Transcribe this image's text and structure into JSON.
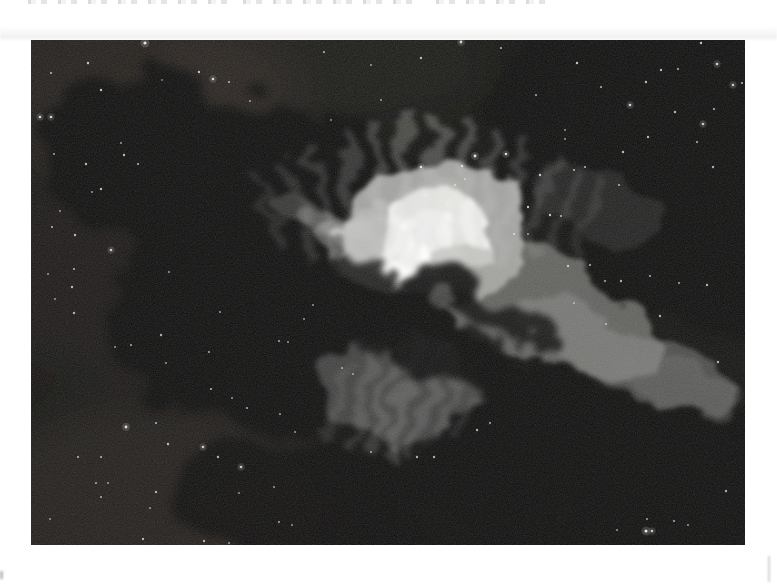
{
  "photo": {
    "subject": "edge-on-dark-nebula-astrophoto-with-bright-core-and-dust-lanes",
    "palette": {
      "page_background": "#ffffff",
      "space_black": "#060605",
      "warm_dust": "#54392e",
      "nebula_mid_gray": "#9a9a98",
      "nebula_core_white": "#f4f4f2",
      "star_white": "#eeeeec"
    },
    "stars": [
      [
        114,
        3,
        1.6,
        0.95
      ],
      [
        57,
        23,
        1.2,
        0.8
      ],
      [
        20,
        33,
        1.1,
        0.7
      ],
      [
        168,
        32,
        1.2,
        0.8
      ],
      [
        182,
        39,
        1.3,
        0.85
      ],
      [
        131,
        40,
        0.9,
        0.5
      ],
      [
        198,
        42,
        1.1,
        0.7
      ],
      [
        70,
        50,
        1.2,
        0.8
      ],
      [
        219,
        61,
        1.0,
        0.6
      ],
      [
        9,
        77,
        1.3,
        0.85
      ],
      [
        20,
        77,
        1.3,
        0.85
      ],
      [
        93,
        115,
        1.2,
        0.75
      ],
      [
        55,
        124,
        1.2,
        0.75
      ],
      [
        107,
        124,
        1.1,
        0.7
      ],
      [
        23,
        114,
        1.0,
        0.65
      ],
      [
        90,
        103,
        1.0,
        0.6
      ],
      [
        70,
        149,
        1.2,
        0.75
      ],
      [
        61,
        152,
        1.0,
        0.6
      ],
      [
        29,
        171,
        1.0,
        0.6
      ],
      [
        21,
        187,
        1.1,
        0.7
      ],
      [
        44,
        195,
        1.2,
        0.75
      ],
      [
        80,
        210,
        1.3,
        0.8
      ],
      [
        43,
        229,
        1.1,
        0.7
      ],
      [
        17,
        234,
        1.0,
        0.6
      ],
      [
        41,
        247,
        1.2,
        0.75
      ],
      [
        24,
        259,
        1.0,
        0.6
      ],
      [
        43,
        273,
        1.2,
        0.7
      ],
      [
        100,
        305,
        1.1,
        0.65
      ],
      [
        84,
        307,
        1.0,
        0.6
      ],
      [
        130,
        295,
        1.2,
        0.7
      ],
      [
        138,
        232,
        1.0,
        0.6
      ],
      [
        189,
        272,
        1.0,
        0.6
      ],
      [
        178,
        312,
        1.1,
        0.65
      ],
      [
        135,
        323,
        1.0,
        0.6
      ],
      [
        180,
        349,
        1.1,
        0.7
      ],
      [
        201,
        358,
        1.0,
        0.6
      ],
      [
        216,
        368,
        1.1,
        0.65
      ],
      [
        95,
        387,
        1.4,
        0.9
      ],
      [
        125,
        383,
        1.1,
        0.7
      ],
      [
        137,
        404,
        1.2,
        0.75
      ],
      [
        172,
        407,
        1.3,
        0.8
      ],
      [
        47,
        417,
        1.1,
        0.7
      ],
      [
        70,
        417,
        1.1,
        0.7
      ],
      [
        187,
        417,
        1.2,
        0.7
      ],
      [
        210,
        427,
        1.3,
        0.8
      ],
      [
        65,
        443,
        1.1,
        0.65
      ],
      [
        77,
        443,
        1.0,
        0.6
      ],
      [
        70,
        457,
        1.1,
        0.65
      ],
      [
        125,
        452,
        1.2,
        0.7
      ],
      [
        119,
        468,
        1.0,
        0.6
      ],
      [
        19,
        479,
        1.0,
        0.6
      ],
      [
        112,
        499,
        1.2,
        0.7
      ],
      [
        173,
        501,
        1.2,
        0.7
      ],
      [
        198,
        503,
        1.0,
        0.6
      ],
      [
        248,
        482,
        1.1,
        0.65
      ],
      [
        261,
        485,
        1.0,
        0.6
      ],
      [
        243,
        447,
        1.1,
        0.6
      ],
      [
        208,
        453,
        1.0,
        0.55
      ],
      [
        446,
        390,
        1.2,
        0.7
      ],
      [
        459,
        383,
        1.1,
        0.65
      ],
      [
        386,
        417,
        1.2,
        0.7
      ],
      [
        403,
        417,
        1.2,
        0.7
      ],
      [
        340,
        412,
        1.1,
        0.6
      ],
      [
        615,
        491,
        1.6,
        0.95
      ],
      [
        621,
        491,
        1.3,
        0.8
      ],
      [
        586,
        490,
        1.0,
        0.6
      ],
      [
        643,
        481,
        1.1,
        0.65
      ],
      [
        657,
        485,
        1.0,
        0.6
      ],
      [
        616,
        479,
        1.1,
        0.6
      ],
      [
        695,
        451,
        1.2,
        0.7
      ],
      [
        687,
        322,
        1.2,
        0.7
      ],
      [
        249,
        374,
        1.1,
        0.6
      ],
      [
        264,
        392,
        1.0,
        0.6
      ],
      [
        273,
        279,
        1.0,
        0.6
      ],
      [
        282,
        265,
        1.0,
        0.6
      ],
      [
        248,
        301,
        1.1,
        0.65
      ],
      [
        257,
        302,
        1.0,
        0.6
      ],
      [
        311,
        328,
        1.1,
        0.6
      ],
      [
        322,
        334,
        1.0,
        0.6
      ],
      [
        390,
        127,
        1.3,
        0.9
      ],
      [
        431,
        126,
        1.2,
        0.8
      ],
      [
        444,
        116,
        1.4,
        0.95
      ],
      [
        475,
        114,
        1.3,
        0.9
      ],
      [
        424,
        145,
        1.1,
        0.7
      ],
      [
        434,
        139,
        1.0,
        0.6
      ],
      [
        394,
        155,
        1.0,
        0.6
      ],
      [
        416,
        164,
        1.0,
        0.6
      ],
      [
        497,
        167,
        1.2,
        0.8
      ],
      [
        519,
        175,
        1.2,
        0.8
      ],
      [
        483,
        194,
        1.1,
        0.7
      ],
      [
        497,
        194,
        1.0,
        0.6
      ],
      [
        530,
        176,
        1.1,
        0.7
      ],
      [
        509,
        135,
        1.2,
        0.8
      ],
      [
        543,
        130,
        1.1,
        0.7
      ],
      [
        546,
        23,
        1.2,
        0.8
      ],
      [
        686,
        24,
        1.3,
        0.85
      ],
      [
        670,
        3,
        1.2,
        0.8
      ],
      [
        630,
        30,
        1.2,
        0.75
      ],
      [
        647,
        29,
        1.1,
        0.7
      ],
      [
        615,
        42,
        1.2,
        0.75
      ],
      [
        702,
        45,
        1.3,
        0.8
      ],
      [
        711,
        43,
        1.1,
        0.7
      ],
      [
        570,
        47,
        1.1,
        0.7
      ],
      [
        599,
        65,
        1.3,
        0.85
      ],
      [
        683,
        69,
        1.1,
        0.7
      ],
      [
        644,
        72,
        1.2,
        0.75
      ],
      [
        672,
        84,
        1.3,
        0.8
      ],
      [
        534,
        90,
        1.0,
        0.6
      ],
      [
        534,
        99,
        1.0,
        0.6
      ],
      [
        617,
        97,
        1.2,
        0.75
      ],
      [
        666,
        102,
        1.1,
        0.7
      ],
      [
        554,
        127,
        1.1,
        0.7
      ],
      [
        592,
        112,
        1.2,
        0.75
      ],
      [
        682,
        127,
        1.2,
        0.7
      ],
      [
        588,
        145,
        1.1,
        0.65
      ],
      [
        537,
        226,
        1.2,
        0.7
      ],
      [
        559,
        225,
        1.1,
        0.7
      ],
      [
        574,
        241,
        1.1,
        0.65
      ],
      [
        590,
        241,
        1.2,
        0.7
      ],
      [
        619,
        236,
        1.1,
        0.65
      ],
      [
        676,
        245,
        1.2,
        0.7
      ],
      [
        648,
        243,
        1.1,
        0.65
      ],
      [
        629,
        276,
        1.2,
        0.7
      ],
      [
        575,
        284,
        1.1,
        0.65
      ],
      [
        543,
        263,
        1.0,
        0.6
      ],
      [
        293,
        12,
        1.1,
        0.7
      ],
      [
        340,
        25,
        1.0,
        0.6
      ],
      [
        390,
        18,
        1.2,
        0.75
      ],
      [
        470,
        8,
        1.1,
        0.7
      ],
      [
        430,
        2,
        1.4,
        0.85
      ],
      [
        505,
        55,
        1.1,
        0.65
      ],
      [
        350,
        60,
        1.0,
        0.6
      ],
      [
        300,
        80,
        1.0,
        0.55
      ]
    ]
  }
}
